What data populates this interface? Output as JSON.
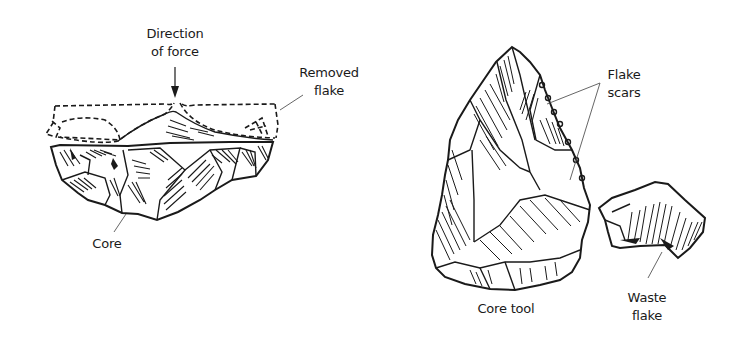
{
  "figure": {
    "left_panel": {
      "name": "Flake removal from core",
      "labels": {
        "direction_line1": "Direction",
        "direction_line2": "of force",
        "removed_line1": "Removed",
        "removed_line2": "flake",
        "core": "Core"
      }
    },
    "right_panel": {
      "name": "Core tool and waste flake",
      "labels": {
        "flake_scars_line1": "Flake",
        "flake_scars_line2": "scars",
        "core_tool": "Core tool",
        "waste_line1": "Waste",
        "waste_line2": "flake"
      }
    },
    "colors": {
      "ink": "#1a1a1a",
      "leader": "#555555",
      "background": "#ffffff"
    }
  }
}
